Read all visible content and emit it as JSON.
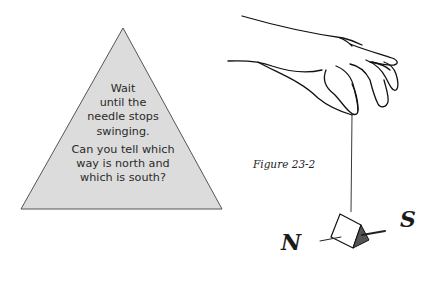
{
  "triangle_note": {
    "lines": [
      "Wait",
      "until the",
      "needle stops",
      "swinging."
    ],
    "question_lines": [
      "Can you tell which",
      "way is north and",
      "which is south?"
    ],
    "fill_color": "#dcdcdc",
    "stroke_color": "#555555"
  },
  "figure": {
    "caption": "Figure 23-2",
    "illustration": "hand-holding-string-with-folded-paper-and-magnetized-needle",
    "labels": {
      "north": "N",
      "south": "S"
    }
  }
}
